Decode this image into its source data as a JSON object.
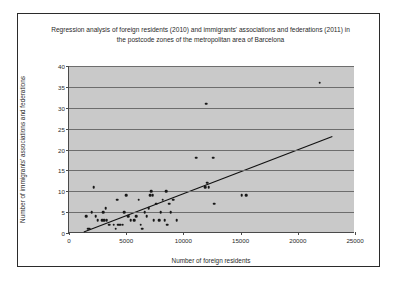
{
  "chart_data": {
    "type": "scatter",
    "title": "Regression analysis of foreign residents (2010) and immigrants' associations and federations (2011) in the postcode zones of the metropolitan area of Barcelona",
    "xlabel": "Number of foreign residents",
    "ylabel": "Number of immigrants' associations and federations",
    "xlim": [
      0,
      25000
    ],
    "ylim": [
      0,
      40
    ],
    "xticks": [
      0,
      5000,
      10000,
      15000,
      20000,
      25000
    ],
    "xtick_labels": [
      "0",
      "5000",
      "10000",
      "15000",
      "20000",
      "25000"
    ],
    "yticks": [
      0,
      5,
      10,
      15,
      20,
      25,
      30,
      35,
      40
    ],
    "ytick_labels": [
      "0",
      "5",
      "10",
      "15",
      "20",
      "25",
      "30",
      "35",
      "40"
    ],
    "grid": "horizontal",
    "legend": "none",
    "plot_background": "#c9c9c9",
    "gridline_color": "#6d6d6d",
    "marker_color": "#171717",
    "trendline_color": "#111111",
    "trendline": {
      "x0": 1300,
      "y0": 0,
      "x1": 23100,
      "y1": 23
    },
    "points": [
      [
        1500,
        4
      ],
      [
        1700,
        1
      ],
      [
        1800,
        1
      ],
      [
        2000,
        5
      ],
      [
        2150,
        11
      ],
      [
        2350,
        4
      ],
      [
        2500,
        3
      ],
      [
        2900,
        3
      ],
      [
        3000,
        5
      ],
      [
        3100,
        3
      ],
      [
        3200,
        6
      ],
      [
        3300,
        3
      ],
      [
        3500,
        2
      ],
      [
        3900,
        2
      ],
      [
        4100,
        1
      ],
      [
        4200,
        8
      ],
      [
        4300,
        2
      ],
      [
        4500,
        2
      ],
      [
        4700,
        2
      ],
      [
        4850,
        5
      ],
      [
        5000,
        9
      ],
      [
        5200,
        4
      ],
      [
        5400,
        3
      ],
      [
        5700,
        3
      ],
      [
        5900,
        4
      ],
      [
        6100,
        8
      ],
      [
        6250,
        2
      ],
      [
        6400,
        1
      ],
      [
        6600,
        5
      ],
      [
        6800,
        4
      ],
      [
        6950,
        6
      ],
      [
        7100,
        9
      ],
      [
        7200,
        10
      ],
      [
        7300,
        9
      ],
      [
        7400,
        3
      ],
      [
        7600,
        7
      ],
      [
        7900,
        3
      ],
      [
        8000,
        5
      ],
      [
        8200,
        8
      ],
      [
        8350,
        3
      ],
      [
        8500,
        10
      ],
      [
        8600,
        2
      ],
      [
        8750,
        7
      ],
      [
        8900,
        5
      ],
      [
        9100,
        8
      ],
      [
        9400,
        3
      ],
      [
        11100,
        18
      ],
      [
        11900,
        11
      ],
      [
        12000,
        31
      ],
      [
        12100,
        12
      ],
      [
        12200,
        11
      ],
      [
        12600,
        18
      ],
      [
        12700,
        7
      ],
      [
        15100,
        9
      ],
      [
        15500,
        9
      ],
      [
        21900,
        36
      ]
    ]
  }
}
